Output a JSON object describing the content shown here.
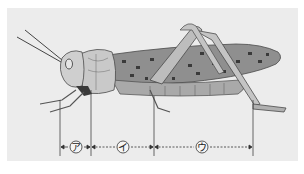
{
  "figure": {
    "background_color": "#ececec",
    "body_colors": {
      "head_thorax": "#c9c9c9",
      "wing": "#8f8f8f",
      "wing_spots": "#3a3a3a",
      "outline": "#4a4a4a",
      "abdomen": "#a9a9a9"
    },
    "dimension_lines": {
      "boundaries_x": [
        60,
        91,
        154,
        253
      ],
      "y": 147,
      "segments": [
        {
          "id": "a",
          "label": "ア",
          "from_x": 60,
          "to_x": 91,
          "style": "solid-ends"
        },
        {
          "id": "i",
          "label": "イ",
          "from_x": 91,
          "to_x": 154,
          "style": "dashed"
        },
        {
          "id": "u",
          "label": "ウ",
          "from_x": 154,
          "to_x": 253,
          "style": "dashed"
        }
      ]
    }
  }
}
